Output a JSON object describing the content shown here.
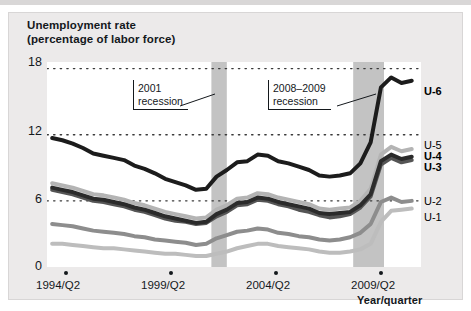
{
  "figure": {
    "title_line1": "Unemployment rate",
    "title_line2": "(percentage of labor force)",
    "axis_title": "Year/quarter"
  },
  "annotations": [
    {
      "name": "recession-2001",
      "line1": "2001",
      "line2": "recession"
    },
    {
      "name": "recession-2008-2009",
      "line1": "2008–2009",
      "line2": "recession"
    }
  ],
  "series_labels": {
    "u6": "U-6",
    "u5": "U-5",
    "u4": "U-4",
    "u3": "U-3",
    "u2": "U-2",
    "u1": "U-1"
  },
  "colors": {
    "u6": "#1c1c1c",
    "u5": "#b4b4b4",
    "u4": "#2b2b2b",
    "u3": "#555555",
    "u2": "#8d8d8d",
    "u1": "#bdbdbd",
    "recession_band": "#c3c3c3",
    "grid": "#3a3a3a",
    "mat": "#eceaea",
    "plot_bg": "#ffffff"
  },
  "chart_data": {
    "type": "line",
    "title": "Unemployment rate (percentage of labor force)",
    "xlabel": "Year/quarter",
    "ylabel": "percentage of labor force",
    "ylim": [
      0,
      18
    ],
    "yticks": [
      0,
      6,
      12,
      18
    ],
    "grid": "dotted-horizontal",
    "legend": "series-end-labels",
    "xlim": [
      "1993/Q1",
      "2010/Q4"
    ],
    "xticks": [
      "1994/Q2",
      "1999/Q2",
      "2004/Q2",
      "2009/Q2"
    ],
    "xtick_years": [
      1994.25,
      1999.25,
      2004.25,
      2009.25
    ],
    "shaded_regions": [
      {
        "label": "2001 recession",
        "start": 2001.0,
        "end": 2001.75
      },
      {
        "label": "2008–2009 recession",
        "start": 2007.9,
        "end": 2009.4
      }
    ],
    "x": [
      1993.25,
      1993.75,
      1994.25,
      1994.75,
      1995.25,
      1995.75,
      1996.25,
      1996.75,
      1997.25,
      1997.75,
      1998.25,
      1998.75,
      1999.25,
      1999.75,
      2000.25,
      2000.75,
      2001.25,
      2001.75,
      2002.25,
      2002.75,
      2003.25,
      2003.75,
      2004.25,
      2004.75,
      2005.25,
      2005.75,
      2006.25,
      2006.75,
      2007.25,
      2007.75,
      2008.25,
      2008.75,
      2009.25,
      2009.75,
      2010.25,
      2010.75
    ],
    "series": [
      {
        "name": "U-6",
        "values": [
          11.7,
          11.5,
          11.2,
          10.8,
          10.3,
          10.1,
          9.9,
          9.7,
          9.2,
          8.9,
          8.5,
          8.0,
          7.7,
          7.4,
          7.0,
          7.1,
          8.2,
          8.8,
          9.5,
          9.6,
          10.2,
          10.1,
          9.6,
          9.4,
          9.1,
          8.8,
          8.3,
          8.2,
          8.3,
          8.5,
          9.4,
          11.3,
          16.3,
          17.2,
          16.7,
          16.9
        ],
        "color": "#1c1c1c",
        "width": 4.0
      },
      {
        "name": "U-5",
        "values": [
          7.6,
          7.4,
          7.2,
          6.9,
          6.6,
          6.5,
          6.3,
          6.1,
          5.8,
          5.6,
          5.3,
          5.0,
          4.8,
          4.6,
          4.4,
          4.5,
          5.2,
          5.6,
          6.2,
          6.3,
          6.7,
          6.6,
          6.3,
          6.1,
          5.9,
          5.7,
          5.3,
          5.2,
          5.3,
          5.4,
          6.0,
          7.1,
          10.2,
          10.9,
          10.5,
          10.7
        ],
        "color": "#b4b4b4",
        "width": 4.0
      },
      {
        "name": "U-4",
        "values": [
          7.2,
          7.0,
          6.8,
          6.5,
          6.2,
          6.1,
          5.9,
          5.7,
          5.4,
          5.2,
          4.9,
          4.6,
          4.4,
          4.2,
          4.0,
          4.1,
          4.8,
          5.2,
          5.8,
          5.9,
          6.3,
          6.2,
          5.9,
          5.7,
          5.5,
          5.3,
          4.9,
          4.8,
          4.9,
          5.0,
          5.6,
          6.6,
          9.6,
          10.2,
          9.8,
          10.0
        ],
        "color": "#2b2b2b",
        "width": 4.0
      },
      {
        "name": "U-3",
        "values": [
          7.0,
          6.8,
          6.6,
          6.3,
          6.0,
          5.9,
          5.7,
          5.5,
          5.2,
          5.0,
          4.7,
          4.4,
          4.2,
          4.1,
          3.9,
          4.0,
          4.6,
          5.0,
          5.6,
          5.7,
          6.1,
          6.0,
          5.7,
          5.5,
          5.2,
          5.0,
          4.7,
          4.5,
          4.6,
          4.8,
          5.4,
          6.4,
          9.3,
          9.9,
          9.5,
          9.7
        ],
        "color": "#555555",
        "width": 4.0
      },
      {
        "name": "U-2",
        "values": [
          3.9,
          3.8,
          3.7,
          3.5,
          3.3,
          3.2,
          3.1,
          3.0,
          2.8,
          2.7,
          2.5,
          2.4,
          2.3,
          2.2,
          2.0,
          2.1,
          2.6,
          2.9,
          3.2,
          3.3,
          3.5,
          3.4,
          3.1,
          3.0,
          2.8,
          2.7,
          2.5,
          2.4,
          2.5,
          2.7,
          3.1,
          3.9,
          5.9,
          6.3,
          5.9,
          6.0
        ],
        "color": "#8d8d8d",
        "width": 4.0
      },
      {
        "name": "U-1",
        "values": [
          2.1,
          2.1,
          2.0,
          1.9,
          1.8,
          1.7,
          1.7,
          1.6,
          1.5,
          1.4,
          1.3,
          1.2,
          1.2,
          1.1,
          1.0,
          1.0,
          1.2,
          1.4,
          1.7,
          1.9,
          2.1,
          2.1,
          1.9,
          1.8,
          1.7,
          1.6,
          1.4,
          1.3,
          1.3,
          1.4,
          1.6,
          2.1,
          4.1,
          5.1,
          5.2,
          5.3
        ],
        "color": "#bdbdbd",
        "width": 4.0
      }
    ]
  }
}
